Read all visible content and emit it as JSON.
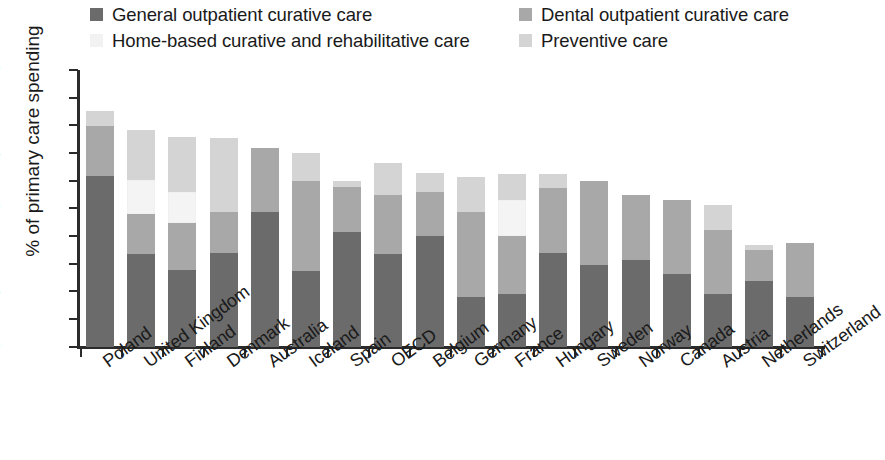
{
  "chart_data": {
    "type": "bar",
    "subtype": "stacked-bar",
    "title": "",
    "xlabel": "",
    "ylabel": "% of primary care spending",
    "ylim": [
      0,
      20
    ],
    "yticks": [
      0,
      2,
      4,
      6,
      8,
      10,
      12,
      14,
      16,
      18,
      20
    ],
    "grid": false,
    "legend_position": "top",
    "categories": [
      "Poland",
      "United Kingdom",
      "Finland",
      "Denmark",
      "Australia",
      "Iceland",
      "Spain",
      "OECD",
      "Belgium",
      "Germany",
      "France",
      "Hungary",
      "Sweden",
      "Norway",
      "Canada",
      "Austria",
      "Netherlands",
      "Switzerland"
    ],
    "series": [
      {
        "name": "General outpatient curative care",
        "color": "#6b6b6b",
        "values": [
          12.4,
          6.7,
          5.6,
          6.8,
          9.8,
          5.5,
          8.3,
          6.7,
          8.0,
          3.6,
          3.8,
          6.8,
          5.9,
          6.3,
          5.3,
          3.8,
          4.8,
          3.6
        ]
      },
      {
        "name": "Dental outpatient curative care",
        "color": "#a8a8a8",
        "values": [
          3.6,
          2.9,
          3.4,
          3.0,
          4.6,
          6.5,
          3.3,
          4.3,
          3.2,
          6.2,
          4.2,
          4.7,
          6.1,
          4.7,
          5.3,
          4.7,
          2.2,
          3.9
        ]
      },
      {
        "name": "Home-based curative and rehabilitative care",
        "color": "#f4f4f4",
        "values": [
          0.0,
          2.5,
          2.2,
          0.0,
          0.0,
          0.0,
          0.0,
          0.0,
          0.0,
          0.0,
          2.6,
          0.0,
          0.0,
          0.0,
          0.0,
          0.0,
          0.0,
          0.0
        ]
      },
      {
        "name": "Preventive care",
        "color": "#d4d4d4",
        "values": [
          1.1,
          3.6,
          4.0,
          5.3,
          0.0,
          2.0,
          0.4,
          2.3,
          1.4,
          2.5,
          1.9,
          1.0,
          0.0,
          0.0,
          0.0,
          1.8,
          0.4,
          0.0
        ]
      }
    ],
    "totals": [
      17.1,
      15.7,
      15.2,
      15.1,
      14.4,
      14.0,
      12.0,
      13.3,
      12.6,
      12.3,
      12.5,
      12.5,
      12.0,
      11.0,
      10.6,
      10.3,
      7.4,
      7.5
    ]
  },
  "legend": {
    "items": [
      {
        "label": "General outpatient curative care",
        "color": "#6b6b6b"
      },
      {
        "label": "Dental outpatient curative care",
        "color": "#a8a8a8"
      },
      {
        "label": "Home-based curative and rehabilitative care",
        "color": "#f2f2f2"
      },
      {
        "label": "Preventive care",
        "color": "#d4d4d4"
      }
    ]
  },
  "axes": {
    "y_title": "% of primary care spending",
    "y_tick_labels": [
      "20",
      "18",
      "16",
      "14",
      "12",
      "10",
      "8",
      "6",
      "4",
      "2",
      "0"
    ]
  }
}
